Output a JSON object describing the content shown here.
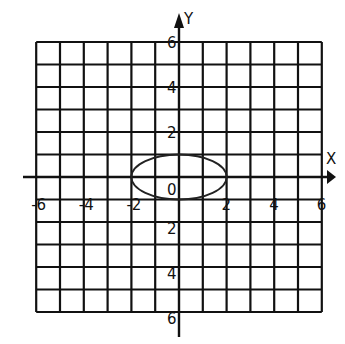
{
  "chart_data": {
    "type": "line",
    "title": "",
    "xlabel": "X",
    "ylabel": "Y",
    "xlim": [
      -6,
      6
    ],
    "ylim": [
      -6,
      6
    ],
    "grid": true,
    "grid_step": 1,
    "x_tick_labels": [
      "-6",
      "-4",
      "-2",
      "2",
      "4",
      "6"
    ],
    "x_tick_values": [
      -6,
      -4,
      -2,
      2,
      4,
      6
    ],
    "y_tick_labels": [
      "6",
      "4",
      "2",
      "2",
      "4",
      "6"
    ],
    "y_tick_values": [
      6,
      4,
      2,
      -2,
      -4,
      -6
    ],
    "origin_label": "0",
    "series": [
      {
        "name": "ellipse",
        "equation": "x^2/4 + y^2 = 1",
        "center": [
          0,
          0
        ],
        "semi_axis_x": 2,
        "semi_axis_y": 1,
        "points": [
          [
            -2,
            0
          ],
          [
            0,
            1
          ],
          [
            2,
            0
          ],
          [
            0,
            -1
          ]
        ]
      }
    ]
  },
  "labels": {
    "x_axis": "X",
    "y_axis": "Y",
    "origin": "0",
    "x_ticks": [
      "-6",
      "-4",
      "-2",
      "2",
      "4",
      "6"
    ],
    "y_ticks_top": [
      "6",
      "4",
      "2"
    ],
    "y_ticks_bottom": [
      "2",
      "4",
      "6"
    ]
  }
}
